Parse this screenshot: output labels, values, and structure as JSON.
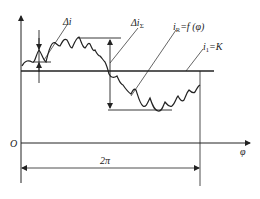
{
  "diagram": {
    "type": "waveform-dimension-diagram",
    "labels": {
      "origin": "O",
      "x_axis": "φ",
      "period": "2π",
      "delta_i": "Δi",
      "delta_i_sigma": "Δi",
      "delta_i_sigma_sub": "Σ",
      "i_r_main": "i",
      "i_r_sub": "R",
      "i_r_eq": "=f (φ)",
      "i1_main": "i",
      "i1_sub": "1",
      "i1_eq": "=K"
    },
    "curves": {
      "i_R": "ripple current curve i_R = f(φ)",
      "i_1": "constant level i_1 = K"
    },
    "colors": {
      "stroke": "#222222",
      "background": "#ffffff"
    }
  }
}
